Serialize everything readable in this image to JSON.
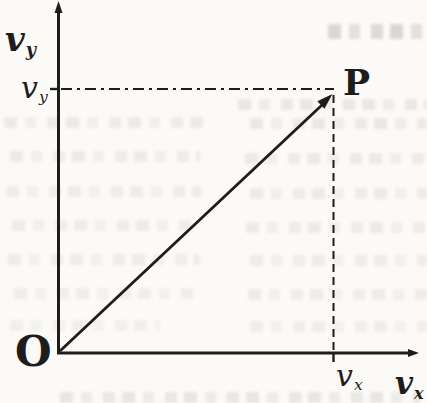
{
  "colors": {
    "ink": "#1e1d1b",
    "paper": "#fbfaf7"
  },
  "figure": {
    "type": "vector-component-diagram",
    "origin_label": "O",
    "point_label": "P",
    "axes": {
      "x": {
        "base": "v",
        "sub": "x"
      },
      "y": {
        "base": "v",
        "sub": "y"
      }
    },
    "components": {
      "x": {
        "base": "v",
        "sub": "x"
      },
      "y": {
        "base": "v",
        "sub": "y"
      }
    },
    "vector": {
      "from": "O",
      "to": "P"
    },
    "guides": [
      {
        "style": "dash-dot",
        "from": "y-axis at v_y",
        "to": "P"
      },
      {
        "style": "dashed",
        "from": "P",
        "to": "x-axis at v_x"
      }
    ]
  }
}
